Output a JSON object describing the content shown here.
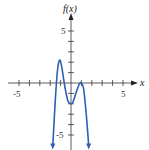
{
  "chart_data": {
    "type": "line",
    "title": "",
    "xlabel": "x",
    "ylabel": "f(x)",
    "xlim": [
      -6,
      6.5
    ],
    "ylim": [
      -6,
      7
    ],
    "grid": false,
    "x_tick_labels": [
      "-5",
      "5"
    ],
    "y_tick_labels": [
      "5",
      "-5"
    ],
    "series": [
      {
        "name": "f(x)",
        "color": "#2f5fb3",
        "x": [
          -1.75,
          -1.5,
          -1.3,
          -1.1,
          -0.9,
          -0.6,
          -0.3,
          0.0,
          0.2,
          0.5,
          0.8,
          1.0,
          1.2,
          1.45,
          1.7
        ],
        "y": [
          -6.0,
          -1.5,
          1.2,
          2.2,
          1.6,
          -0.3,
          -1.7,
          -2.0,
          -1.8,
          -0.9,
          -0.1,
          0.0,
          -0.5,
          -2.8,
          -6.0
        ]
      }
    ],
    "key_points": [
      {
        "label": "local max",
        "x": -1.1,
        "y": 2.2
      },
      {
        "label": "local min",
        "x": 0.0,
        "y": -2.0
      },
      {
        "label": "local max",
        "x": 1.0,
        "y": 0.0
      }
    ]
  },
  "labels": {
    "y_axis": "f(x)",
    "x_axis": "x",
    "x_neg": "-5",
    "x_pos": "5",
    "y_pos": "5",
    "y_neg": "-5"
  }
}
